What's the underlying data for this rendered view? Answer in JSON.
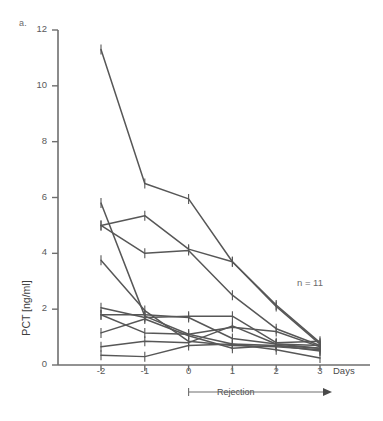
{
  "figure": {
    "panel_label": "a.",
    "annotation_n": "n = 11"
  },
  "chart_data": {
    "type": "line",
    "title": "",
    "xlabel": "Days",
    "ylabel": "PCT [ng/ml]",
    "xlim": [
      -2.45,
      3.45
    ],
    "ylim": [
      0,
      12
    ],
    "x": [
      -2,
      -1,
      0,
      1,
      2,
      3
    ],
    "x_tick_labels": [
      "-2",
      "-1",
      "0",
      "1",
      "2",
      "3"
    ],
    "y_ticks": [
      0,
      2,
      4,
      6,
      8,
      10,
      12
    ],
    "y_tick_labels": [
      "0",
      "2",
      "4",
      "6",
      "8",
      "10",
      "12"
    ],
    "grid": false,
    "legend": "none",
    "line_color": "#575757",
    "axis_color": "#6e6e6e",
    "n_patients": 11,
    "annotations": [
      {
        "text": "n = 11",
        "x": 2.55,
        "y": 3.0
      },
      {
        "text": "Rejection",
        "x_start": 0,
        "x_end": 3.3,
        "y": -1.5,
        "arrow": true
      }
    ],
    "series": [
      {
        "name": "patient-1",
        "values": [
          11.3,
          6.5,
          5.95,
          3.7,
          2.15,
          0.8
        ]
      },
      {
        "name": "patient-2",
        "values": [
          5.8,
          1.75,
          1.1,
          0.75,
          0.7,
          0.6
        ]
      },
      {
        "name": "patient-3",
        "values": [
          5.0,
          5.35,
          4.15,
          3.7,
          2.1,
          0.75
        ]
      },
      {
        "name": "patient-4",
        "values": [
          5.0,
          4.0,
          4.1,
          2.5,
          1.3,
          0.7
        ]
      },
      {
        "name": "patient-5",
        "values": [
          3.75,
          1.95,
          0.85,
          0.7,
          0.65,
          0.55
        ]
      },
      {
        "name": "patient-6",
        "values": [
          2.05,
          1.7,
          1.75,
          1.75,
          0.8,
          0.85
        ]
      },
      {
        "name": "patient-7",
        "values": [
          1.8,
          1.8,
          1.7,
          0.95,
          0.75,
          0.7
        ]
      },
      {
        "name": "patient-8",
        "values": [
          1.8,
          1.15,
          1.1,
          1.35,
          1.2,
          0.65
        ]
      },
      {
        "name": "patient-9",
        "values": [
          1.15,
          1.65,
          1.05,
          0.6,
          0.7,
          0.5
        ]
      },
      {
        "name": "patient-10",
        "values": [
          0.65,
          0.85,
          0.8,
          1.4,
          0.75,
          0.6
        ]
      },
      {
        "name": "patient-11",
        "values": [
          0.35,
          0.3,
          0.7,
          0.75,
          0.55,
          0.25
        ]
      }
    ],
    "error_bar_days": [
      -2,
      -1,
      0,
      1,
      2,
      3
    ]
  }
}
